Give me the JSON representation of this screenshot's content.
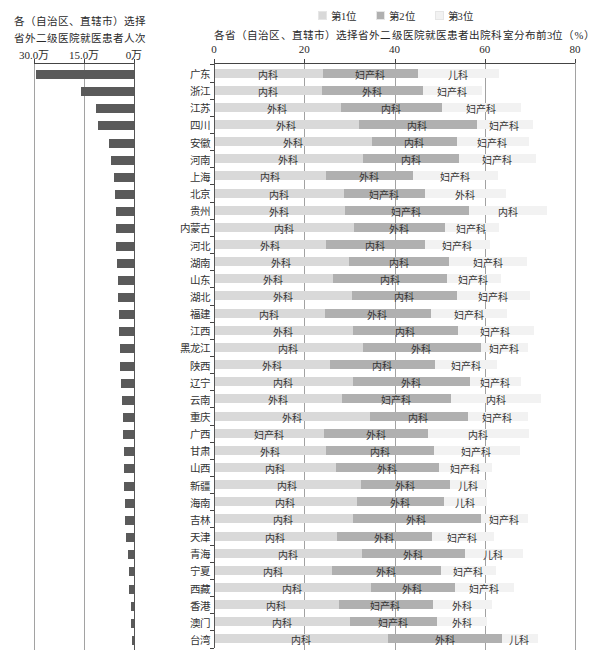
{
  "chart_data": [
    {
      "type": "bar",
      "orientation": "horizontal",
      "direction": "right-to-left",
      "title": "各（自治区、直辖市）选择省外二级医院就医患者人次",
      "title_lines": [
        "各（自治区、直辖市）选择",
        "省外二级医院就医患者人次"
      ],
      "xlabel": "",
      "ylabel": "",
      "unit": "万",
      "xlim": [
        30,
        0
      ],
      "xticks": [
        "30.0万",
        "15.0万",
        "0万"
      ],
      "xtick_values": [
        30,
        15,
        0
      ],
      "grid": true,
      "categories": [
        "广东",
        "浙江",
        "江苏",
        "四川",
        "安徽",
        "河南",
        "上海",
        "北京",
        "贵州",
        "内蒙古",
        "河北",
        "湖南",
        "山东",
        "湖北",
        "福建",
        "江西",
        "黑龙江",
        "陕西",
        "辽宁",
        "云南",
        "重庆",
        "广西",
        "甘肃",
        "山西",
        "新疆",
        "海南",
        "吉林",
        "天津",
        "青海",
        "宁夏",
        "西藏",
        "香港",
        "澳门",
        "台湾"
      ],
      "values": [
        29.3,
        15.8,
        11.4,
        10.8,
        7.6,
        6.9,
        6.1,
        5.6,
        5.5,
        5.4,
        5.4,
        5.1,
        4.9,
        4.8,
        4.5,
        4.4,
        4.2,
        4.1,
        3.8,
        3.5,
        3.3,
        3.2,
        3.1,
        3.0,
        3.0,
        2.8,
        2.7,
        2.3,
        1.8,
        1.6,
        1.4,
        1.0,
        0.8,
        0.7
      ]
    },
    {
      "type": "bar",
      "stacked": true,
      "orientation": "horizontal",
      "title": "各省（自治区、直辖市）选择省外二级医院就医患者出院科室分布前3位（%）",
      "xlabel": "",
      "ylabel": "",
      "xlim": [
        0,
        80
      ],
      "xticks": [
        "0",
        "20",
        "40",
        "60",
        "80"
      ],
      "xtick_values": [
        0,
        20,
        40,
        60,
        80
      ],
      "grid": true,
      "legend_position": "top",
      "categories": [
        "广东",
        "浙江",
        "江苏",
        "四川",
        "安徽",
        "河南",
        "上海",
        "北京",
        "贵州",
        "内蒙古",
        "河北",
        "湖南",
        "山东",
        "湖北",
        "福建",
        "江西",
        "黑龙江",
        "陕西",
        "辽宁",
        "云南",
        "重庆",
        "广西",
        "甘肃",
        "山西",
        "新疆",
        "海南",
        "吉林",
        "天津",
        "青海",
        "宁夏",
        "西藏",
        "香港",
        "澳门",
        "台湾"
      ],
      "series": [
        {
          "name": "第1位",
          "color": "#d9d9d9",
          "departments": [
            "内科",
            "内科",
            "外科",
            "外科",
            "外科",
            "外科",
            "内科",
            "内科",
            "外科",
            "内科",
            "外科",
            "外科",
            "外科",
            "外科",
            "内科",
            "外科",
            "内科",
            "外科",
            "内科",
            "外科",
            "外科",
            "妇产科",
            "外科",
            "内科",
            "内科",
            "内科",
            "内科",
            "内科",
            "内科",
            "内科",
            "内科",
            "内科",
            "内科",
            "内科"
          ],
          "values": [
            24.1,
            23.9,
            28.1,
            32.0,
            34.9,
            33.0,
            24.8,
            28.7,
            28.9,
            31.0,
            24.6,
            29.8,
            26.3,
            30.4,
            24.5,
            30.6,
            32.8,
            25.6,
            30.6,
            28.2,
            34.5,
            24.2,
            24.8,
            27.0,
            32.4,
            31.6,
            30.6,
            27.2,
            32.7,
            26.0,
            34.6,
            27.5,
            30.1,
            38.4
          ]
        },
        {
          "name": "第2位",
          "color": "#b0b0b0",
          "departments": [
            "妇产科",
            "外科",
            "内科",
            "内科",
            "内科",
            "内科",
            "外科",
            "妇产科",
            "妇产科",
            "外科",
            "内科",
            "内科",
            "内科",
            "内科",
            "外科",
            "内科",
            "外科",
            "内科",
            "外科",
            "妇产科",
            "内科",
            "外科",
            "内科",
            "外科",
            "外科",
            "外科",
            "外科",
            "外科",
            "外科",
            "外科",
            "外科",
            "妇产科",
            "妇产科",
            "外科"
          ],
          "values": [
            20.9,
            22.4,
            22.3,
            26.1,
            18.8,
            21.2,
            19.1,
            18.0,
            27.5,
            20.0,
            22.0,
            22.2,
            25.2,
            23.4,
            23.4,
            23.4,
            26.2,
            23.3,
            26.1,
            24.3,
            21.6,
            23.2,
            23.9,
            22.8,
            19.7,
            19.3,
            28.4,
            20.9,
            22.8,
            24.3,
            18.6,
            20.9,
            19.1,
            25.4
          ]
        },
        {
          "name": "第3位",
          "color": "#f2f2f2",
          "departments": [
            "儿科",
            "妇产科",
            "妇产科",
            "妇产科",
            "妇产科",
            "妇产科",
            "妇产科",
            "外科",
            "内科",
            "妇产科",
            "妇产科",
            "妇产科",
            "妇产科",
            "妇产科",
            "妇产科",
            "妇产科",
            "妇产科",
            "妇产科",
            "妇产科",
            "内科",
            "妇产科",
            "内科",
            "妇产科",
            "妇产科",
            "儿科",
            "儿科",
            "妇产科",
            "妇产科",
            "儿科",
            "妇产科",
            "妇产科",
            "外科",
            "外科",
            "儿科"
          ],
          "values": [
            18.0,
            13.0,
            17.5,
            12.5,
            16.0,
            17.0,
            19.0,
            17.8,
            17.3,
            12.0,
            14.5,
            17.3,
            12.0,
            16.2,
            17.0,
            16.7,
            10.4,
            13.8,
            11.2,
            19.8,
            13.3,
            22.3,
            18.9,
            11.8,
            8.4,
            9.6,
            10.4,
            13.8,
            12.8,
            12.1,
            13.2,
            13.2,
            11.3,
            7.8
          ]
        }
      ]
    }
  ]
}
